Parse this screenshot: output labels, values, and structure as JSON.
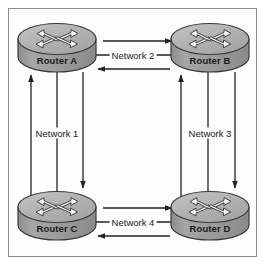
{
  "diagram": {
    "type": "network-topology",
    "background_color": "#fdfdfd",
    "border_color": "#8d8d8d",
    "line_color": "#222222",
    "text_color": "#1b1b1b",
    "router_body_color": "#9a9a9a",
    "router_top_color": "#b4b4b4",
    "router_outline_color": "#3a3a3a",
    "nodes": [
      {
        "id": "A",
        "label": "Router A",
        "icon": "router-icon",
        "cx": 57,
        "cy": 47,
        "position": "top-left"
      },
      {
        "id": "B",
        "label": "Router B",
        "icon": "router-icon",
        "cx": 210,
        "cy": 47,
        "position": "top-right"
      },
      {
        "id": "C",
        "label": "Router C",
        "icon": "router-icon",
        "cx": 57,
        "cy": 215,
        "position": "bottom-left"
      },
      {
        "id": "D",
        "label": "Router D",
        "icon": "router-icon",
        "cx": 210,
        "cy": 215,
        "position": "bottom-right"
      }
    ],
    "links": [
      {
        "id": "network-1",
        "label": "Network 1",
        "orientation": "vertical",
        "between": [
          "Router A",
          "Router C"
        ],
        "label_x": 57,
        "label_y": 133,
        "arrows": [
          "up",
          "none",
          "down"
        ]
      },
      {
        "id": "network-2",
        "label": "Network 2",
        "orientation": "horizontal",
        "between": [
          "Router A",
          "Router B"
        ],
        "label_x": 133,
        "label_y": 55,
        "arrows": [
          "right",
          "none",
          "left"
        ]
      },
      {
        "id": "network-3",
        "label": "Network 3",
        "orientation": "vertical",
        "between": [
          "Router B",
          "Router D"
        ],
        "label_x": 210,
        "label_y": 133,
        "arrows": [
          "up",
          "none",
          "down"
        ]
      },
      {
        "id": "network-4",
        "label": "Network 4",
        "orientation": "horizontal",
        "between": [
          "Router C",
          "Router D"
        ],
        "label_x": 133,
        "label_y": 222,
        "arrows": [
          "right",
          "none",
          "left"
        ]
      }
    ]
  }
}
